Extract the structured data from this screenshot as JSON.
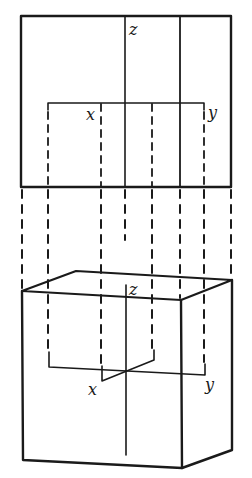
{
  "diagram": {
    "title": "",
    "colors": {
      "line": "#1a1a1a",
      "background": "#ffffff"
    },
    "top_view": {
      "labels": {
        "z": "z",
        "x": "x",
        "y": "y"
      }
    },
    "bottom_view": {
      "labels": {
        "z": "z",
        "x": "x",
        "y": "y"
      }
    }
  }
}
